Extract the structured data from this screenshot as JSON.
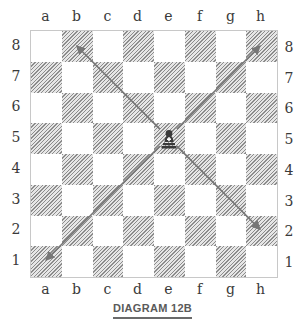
{
  "diagram": {
    "caption": "DIAGRAM 12B",
    "files": [
      "a",
      "b",
      "c",
      "d",
      "e",
      "f",
      "g",
      "h"
    ],
    "ranks": [
      "8",
      "7",
      "6",
      "5",
      "4",
      "3",
      "2",
      "1"
    ],
    "pieces": [
      {
        "square": "e5",
        "piece": "bishop",
        "color": "white",
        "glyph": "♝"
      }
    ],
    "arrows": [
      {
        "from": "e5",
        "to": "b8"
      },
      {
        "from": "e5",
        "to": "h8"
      },
      {
        "from": "e5",
        "to": "a1"
      },
      {
        "from": "e5",
        "to": "h2"
      }
    ],
    "colors": {
      "dark_square_hatch": "#8c8c8c",
      "arrow": "#777777",
      "border": "#c8c8c8"
    }
  }
}
